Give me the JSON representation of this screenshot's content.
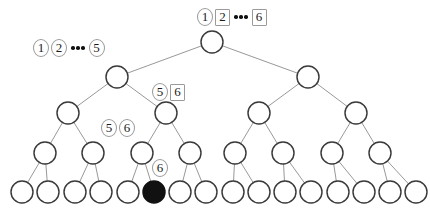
{
  "figure": {
    "width": 430,
    "height": 215,
    "background_color": "#ffffff",
    "node_stroke_color": "#3a3a3a",
    "edge_color": "#8c8c8c",
    "filled_node_color": "#111111",
    "badge_border_color": "#9a9a9a"
  },
  "tree": {
    "levels": [
      {
        "index": 0,
        "name": "root-level",
        "y": 42,
        "radius": 11,
        "nodes": [
          {
            "id": "n0-0",
            "x": 212,
            "filled": false
          }
        ]
      },
      {
        "index": 1,
        "name": "level-1",
        "y": 77,
        "radius": 11,
        "nodes": [
          {
            "id": "n1-0",
            "x": 117,
            "filled": false
          },
          {
            "id": "n1-1",
            "x": 308,
            "filled": false
          }
        ]
      },
      {
        "index": 2,
        "name": "level-2",
        "y": 113,
        "radius": 11,
        "nodes": [
          {
            "id": "n2-0",
            "x": 68,
            "filled": false
          },
          {
            "id": "n2-1",
            "x": 166,
            "filled": false
          },
          {
            "id": "n2-2",
            "x": 259,
            "filled": false
          },
          {
            "id": "n2-3",
            "x": 356,
            "filled": false
          }
        ]
      },
      {
        "index": 3,
        "name": "level-3",
        "y": 153,
        "radius": 11,
        "nodes": [
          {
            "id": "n3-0",
            "x": 45,
            "filled": false
          },
          {
            "id": "n3-1",
            "x": 93,
            "filled": false
          },
          {
            "id": "n3-2",
            "x": 142,
            "filled": false
          },
          {
            "id": "n3-3",
            "x": 190,
            "filled": false
          },
          {
            "id": "n3-4",
            "x": 235,
            "filled": false
          },
          {
            "id": "n3-5",
            "x": 283,
            "filled": false
          },
          {
            "id": "n3-6",
            "x": 332,
            "filled": false
          },
          {
            "id": "n3-7",
            "x": 380,
            "filled": false
          }
        ]
      },
      {
        "index": 4,
        "name": "leaf-level",
        "y": 192,
        "radius": 11,
        "nodes": [
          {
            "id": "n4-0",
            "x": 22,
            "filled": false
          },
          {
            "id": "n4-1",
            "x": 48,
            "filled": false
          },
          {
            "id": "n4-2",
            "x": 75,
            "filled": false
          },
          {
            "id": "n4-3",
            "x": 101,
            "filled": false
          },
          {
            "id": "n4-4",
            "x": 128,
            "filled": false
          },
          {
            "id": "n4-5",
            "x": 154,
            "filled": true
          },
          {
            "id": "n4-6",
            "x": 180,
            "filled": false
          },
          {
            "id": "n4-7",
            "x": 206,
            "filled": false
          },
          {
            "id": "n4-8",
            "x": 233,
            "filled": false
          },
          {
            "id": "n4-9",
            "x": 259,
            "filled": false
          },
          {
            "id": "n4-10",
            "x": 285,
            "filled": false
          },
          {
            "id": "n4-11",
            "x": 311,
            "filled": false
          },
          {
            "id": "n4-12",
            "x": 338,
            "filled": false
          },
          {
            "id": "n4-13",
            "x": 364,
            "filled": false
          },
          {
            "id": "n4-14",
            "x": 390,
            "filled": false
          },
          {
            "id": "n4-15",
            "x": 416,
            "filled": false
          }
        ]
      }
    ]
  },
  "labels": [
    {
      "id": "label-root",
      "name": "root-label",
      "x": 197,
      "y": 8,
      "items": [
        {
          "text": "1",
          "shape": "circle"
        },
        {
          "text": "2",
          "shape": "square"
        },
        {
          "text": "",
          "shape": "dots"
        },
        {
          "text": "6",
          "shape": "square"
        }
      ]
    },
    {
      "id": "label-level1-left",
      "name": "level1-left-label",
      "x": 33,
      "y": 39,
      "items": [
        {
          "text": "1",
          "shape": "circle"
        },
        {
          "text": "2",
          "shape": "circle"
        },
        {
          "text": "",
          "shape": "dots"
        },
        {
          "text": "5",
          "shape": "circle"
        }
      ]
    },
    {
      "id": "label-level2",
      "name": "level2-label",
      "x": 152,
      "y": 83,
      "items": [
        {
          "text": "5",
          "shape": "circle"
        },
        {
          "text": "6",
          "shape": "square"
        }
      ]
    },
    {
      "id": "label-level3",
      "name": "level3-label",
      "x": 101,
      "y": 119,
      "items": [
        {
          "text": "5",
          "shape": "circle"
        },
        {
          "text": "6",
          "shape": "circle"
        }
      ]
    },
    {
      "id": "label-leaf",
      "name": "leaf-label",
      "x": 152,
      "y": 159,
      "items": [
        {
          "text": "6",
          "shape": "circle"
        }
      ]
    }
  ]
}
